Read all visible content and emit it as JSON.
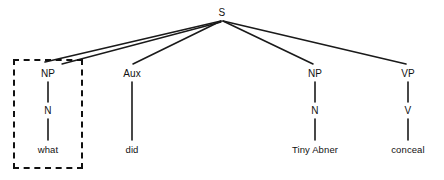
{
  "figure": {
    "type": "syntax-tree",
    "width": 444,
    "height": 180,
    "background_color": "#ffffff",
    "line_color": "#1a1a1a",
    "text_color": "#111111"
  },
  "nodes": {
    "root": {
      "label": "S",
      "x": 222,
      "y": 13
    },
    "wh_np": {
      "label": "NP",
      "x": 48,
      "y": 74
    },
    "wh_n": {
      "label": "N",
      "x": 48,
      "y": 111
    },
    "wh_word": {
      "label": "what",
      "x": 48,
      "y": 150
    },
    "aux": {
      "label": "Aux",
      "x": 132,
      "y": 74
    },
    "aux_word": {
      "label": "did",
      "x": 132,
      "y": 150
    },
    "subj_np": {
      "label": "NP",
      "x": 315,
      "y": 74
    },
    "subj_n": {
      "label": "N",
      "x": 315,
      "y": 111
    },
    "subj_word": {
      "label": "Tiny Abner",
      "x": 315,
      "y": 150
    },
    "vp": {
      "label": "VP",
      "x": 408,
      "y": 74
    },
    "v": {
      "label": "V",
      "x": 408,
      "y": 111
    },
    "verb_word": {
      "label": "conceal",
      "x": 408,
      "y": 150
    }
  },
  "branches": [
    {
      "name": "s-to-wh-np",
      "x1": 221,
      "y1": 21,
      "x2": 45,
      "y2": 62
    },
    {
      "name": "s-to-wh-np-secondary",
      "x1": 221,
      "y1": 22,
      "x2": 62,
      "y2": 64
    },
    {
      "name": "s-to-aux",
      "x1": 221,
      "y1": 21,
      "x2": 133,
      "y2": 64
    },
    {
      "name": "s-to-subj-np",
      "x1": 223,
      "y1": 21,
      "x2": 313,
      "y2": 64
    },
    {
      "name": "s-to-vp",
      "x1": 223,
      "y1": 21,
      "x2": 406,
      "y2": 64
    },
    {
      "name": "wh-np-to-n",
      "x1": 48,
      "y1": 82,
      "x2": 48,
      "y2": 102
    },
    {
      "name": "wh-n-to-word",
      "x1": 48,
      "y1": 119,
      "x2": 48,
      "y2": 140
    },
    {
      "name": "aux-to-word",
      "x1": 132,
      "y1": 82,
      "x2": 132,
      "y2": 140
    },
    {
      "name": "subj-np-to-n",
      "x1": 315,
      "y1": 82,
      "x2": 315,
      "y2": 102
    },
    {
      "name": "subj-n-to-word",
      "x1": 315,
      "y1": 119,
      "x2": 315,
      "y2": 140
    },
    {
      "name": "vp-to-v",
      "x1": 408,
      "y1": 82,
      "x2": 408,
      "y2": 102
    },
    {
      "name": "v-to-word",
      "x1": 408,
      "y1": 119,
      "x2": 408,
      "y2": 140
    }
  ],
  "highlight_box": {
    "name": "moved-wh-constituent",
    "x": 13,
    "y": 59,
    "width": 70,
    "height": 110,
    "style": "dashed"
  }
}
